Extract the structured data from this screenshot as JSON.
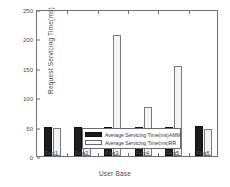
{
  "chart_data": {
    "type": "bar",
    "title": "",
    "xlabel": "User Base",
    "ylabel": "Request Servicing Time(ms)",
    "categories": [
      "Fog1",
      "Fog2",
      "Fog3",
      "Fog4",
      "Fog5",
      "Fog6"
    ],
    "series": [
      {
        "name": "Average Servicing Time(ms)AMM",
        "color": "#1c1c1c",
        "values": [
          50,
          50,
          50,
          49,
          50,
          51
        ]
      },
      {
        "name": "Average Servicing Time(ms)RR",
        "color": "#f4f4f4",
        "values": [
          47,
          44,
          206,
          84,
          153,
          46
        ]
      }
    ],
    "ylim": [
      0,
      250
    ],
    "yticks": [
      0,
      50,
      100,
      150,
      200,
      250
    ],
    "ytick_labels": [
      "0",
      "50",
      "100",
      "150",
      "200",
      "250"
    ],
    "grid": false,
    "legend_position": "lower-right-inside"
  },
  "axes": {
    "y_title": "Request Servicing Time(ms)",
    "x_title": "User Base"
  }
}
